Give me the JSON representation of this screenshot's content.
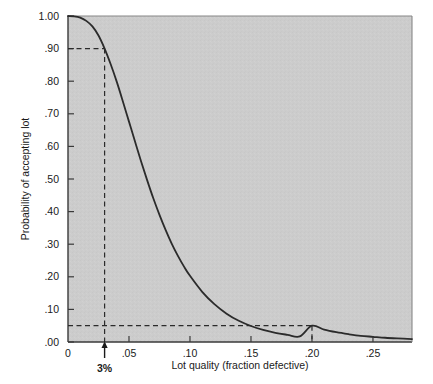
{
  "chart_data": {
    "type": "line",
    "title": "",
    "subtitle": "",
    "xlabel": "Lot quality (fraction defective)",
    "ylabel": "Probability of accepting lot",
    "xlim": [
      0,
      0.282
    ],
    "ylim": [
      0,
      1.0
    ],
    "grid": false,
    "legend": null,
    "xticks": [
      {
        "value": 0,
        "label": "0"
      },
      {
        "value": 0.05,
        "label": ".05"
      },
      {
        "value": 0.1,
        "label": ".10"
      },
      {
        "value": 0.15,
        "label": ".15"
      },
      {
        "value": 0.2,
        "label": ".20"
      },
      {
        "value": 0.25,
        "label": ".25"
      }
    ],
    "yticks": [
      {
        "value": 0.0,
        "label": ".00"
      },
      {
        "value": 0.1,
        "label": ".10"
      },
      {
        "value": 0.2,
        "label": ".20"
      },
      {
        "value": 0.3,
        "label": ".30"
      },
      {
        "value": 0.4,
        "label": ".40"
      },
      {
        "value": 0.5,
        "label": ".50"
      },
      {
        "value": 0.6,
        "label": ".60"
      },
      {
        "value": 0.7,
        "label": ".70"
      },
      {
        "value": 0.8,
        "label": ".80"
      },
      {
        "value": 0.9,
        "label": ".90"
      },
      {
        "value": 1.0,
        "label": "1.00"
      }
    ],
    "series": [
      {
        "name": "OC curve",
        "color": "#2b2b2b",
        "x": [
          0.0,
          0.005,
          0.01,
          0.015,
          0.02,
          0.025,
          0.03,
          0.035,
          0.04,
          0.045,
          0.05,
          0.055,
          0.06,
          0.065,
          0.07,
          0.075,
          0.08,
          0.085,
          0.09,
          0.095,
          0.1,
          0.11,
          0.12,
          0.13,
          0.14,
          0.15,
          0.16,
          0.17,
          0.18,
          0.19,
          0.2,
          0.21,
          0.22,
          0.23,
          0.24,
          0.25,
          0.26,
          0.27,
          0.282
        ],
        "y": [
          1.0,
          0.999,
          0.995,
          0.985,
          0.968,
          0.94,
          0.9,
          0.852,
          0.798,
          0.738,
          0.676,
          0.614,
          0.553,
          0.495,
          0.44,
          0.39,
          0.344,
          0.302,
          0.265,
          0.232,
          0.203,
          0.154,
          0.116,
          0.087,
          0.065,
          0.049,
          0.037,
          0.028,
          0.022,
          0.017,
          0.05,
          0.038,
          0.03,
          0.024,
          0.019,
          0.016,
          0.013,
          0.011,
          0.009
        ]
      }
    ],
    "annotations": [
      {
        "name": "producers-risk-guide",
        "kind": "dashed-guide",
        "x": 0.03,
        "y": 0.9,
        "label": "3%",
        "note": "dashed lines from y=.90 axis to curve, then down to x=3%"
      },
      {
        "name": "consumers-risk-guide",
        "kind": "dashed-guide",
        "x": 0.2,
        "y": 0.05,
        "label": "",
        "note": "dashed line from y=.05 axis to curve at x=.20, then down to axis"
      }
    ],
    "arrow_label": "3%"
  },
  "colors": {
    "plot_background": "#cccccc",
    "page_background": "#ffffff",
    "curve": "#2b2b2b",
    "axis": "#3a3a3a",
    "dashed_guide": "#2b2b2b",
    "text": "#1a1a1a"
  }
}
